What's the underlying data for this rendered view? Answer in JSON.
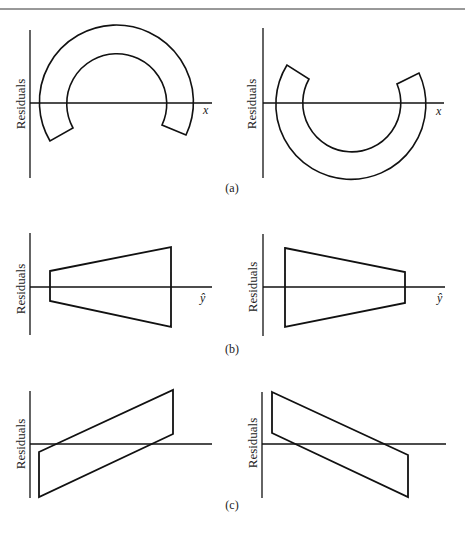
{
  "figure": {
    "panels": [
      {
        "id": "a",
        "caption": "(a)",
        "plots": [
          {
            "side": "left",
            "ylabel": "Residuals",
            "xlabel": "x",
            "shape": "arch-band-opening-down"
          },
          {
            "side": "right",
            "ylabel": "Residuals",
            "xlabel": "x",
            "shape": "arch-band-opening-up"
          }
        ]
      },
      {
        "id": "b",
        "caption": "(b)",
        "plots": [
          {
            "side": "left",
            "ylabel": "Residuals",
            "xlabel": "ŷ",
            "shape": "funnel-widening"
          },
          {
            "side": "right",
            "ylabel": "Residuals",
            "xlabel": "ŷ",
            "shape": "funnel-narrowing"
          }
        ]
      },
      {
        "id": "c",
        "caption": "(c)",
        "plots": [
          {
            "side": "left",
            "ylabel": "Residuals",
            "xlabel": "",
            "shape": "band-increasing"
          },
          {
            "side": "right",
            "ylabel": "Residuals",
            "xlabel": "",
            "shape": "band-decreasing"
          }
        ]
      }
    ],
    "stroke_color": "#111111"
  }
}
